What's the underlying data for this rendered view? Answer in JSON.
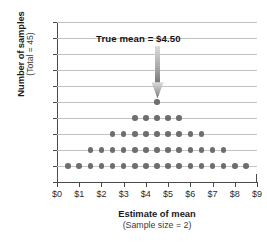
{
  "chart_data": {
    "type": "scatter",
    "title": "",
    "xlabel": "Estimate of mean",
    "xlabel_sub": "(Sample size = 2)",
    "ylabel": "Number of samples",
    "ylabel_sub": "(Total = 45)",
    "xlim": [
      0,
      9
    ],
    "ylim": [
      0,
      10
    ],
    "grid": true,
    "legend": "none",
    "x_tick_labels": [
      "$0",
      "$1",
      "$2",
      "$3",
      "$4",
      "$5",
      "$6",
      "$7",
      "$8",
      "$9"
    ],
    "x_tick_values": [
      0,
      1,
      2,
      3,
      4,
      5,
      6,
      7,
      8,
      9
    ],
    "y_tick_labels": [
      "0",
      "1",
      "2",
      "3",
      "4",
      "5",
      "6",
      "7",
      "8",
      "9",
      "10"
    ],
    "y_tick_values": [
      0,
      1,
      2,
      3,
      4,
      5,
      6,
      7,
      8,
      9,
      10
    ],
    "points": [
      {
        "x": 0.5,
        "y": 1
      },
      {
        "x": 1.0,
        "y": 1
      },
      {
        "x": 1.5,
        "y": 1
      },
      {
        "x": 2.0,
        "y": 1
      },
      {
        "x": 2.5,
        "y": 1
      },
      {
        "x": 3.0,
        "y": 1
      },
      {
        "x": 3.5,
        "y": 1
      },
      {
        "x": 4.0,
        "y": 1
      },
      {
        "x": 4.5,
        "y": 1
      },
      {
        "x": 5.0,
        "y": 1
      },
      {
        "x": 5.5,
        "y": 1
      },
      {
        "x": 6.0,
        "y": 1
      },
      {
        "x": 6.5,
        "y": 1
      },
      {
        "x": 7.0,
        "y": 1
      },
      {
        "x": 7.5,
        "y": 1
      },
      {
        "x": 8.0,
        "y": 1
      },
      {
        "x": 8.5,
        "y": 1
      },
      {
        "x": 1.5,
        "y": 2
      },
      {
        "x": 2.0,
        "y": 2
      },
      {
        "x": 2.5,
        "y": 2
      },
      {
        "x": 3.0,
        "y": 2
      },
      {
        "x": 3.5,
        "y": 2
      },
      {
        "x": 4.0,
        "y": 2
      },
      {
        "x": 4.5,
        "y": 2
      },
      {
        "x": 5.0,
        "y": 2
      },
      {
        "x": 5.5,
        "y": 2
      },
      {
        "x": 6.0,
        "y": 2
      },
      {
        "x": 6.5,
        "y": 2
      },
      {
        "x": 7.0,
        "y": 2
      },
      {
        "x": 7.5,
        "y": 2
      },
      {
        "x": 2.5,
        "y": 3
      },
      {
        "x": 3.0,
        "y": 3
      },
      {
        "x": 3.5,
        "y": 3
      },
      {
        "x": 4.0,
        "y": 3
      },
      {
        "x": 4.5,
        "y": 3
      },
      {
        "x": 5.0,
        "y": 3
      },
      {
        "x": 5.5,
        "y": 3
      },
      {
        "x": 6.0,
        "y": 3
      },
      {
        "x": 6.5,
        "y": 3
      },
      {
        "x": 3.5,
        "y": 4
      },
      {
        "x": 4.0,
        "y": 4
      },
      {
        "x": 4.5,
        "y": 4
      },
      {
        "x": 5.0,
        "y": 4
      },
      {
        "x": 5.5,
        "y": 4
      },
      {
        "x": 4.5,
        "y": 5
      }
    ],
    "dot_counts_by_estimate": {
      "0.5": 1,
      "1.0": 1,
      "1.5": 2,
      "2.0": 2,
      "2.5": 3,
      "3.0": 3,
      "3.5": 4,
      "4.0": 4,
      "4.5": 5,
      "5.0": 4,
      "5.5": 4,
      "6.0": 3,
      "6.5": 3,
      "7.0": 2,
      "7.5": 2,
      "8.0": 1,
      "8.5": 1
    },
    "total_samples": 45,
    "annotation": {
      "text": "True mean  =  $4.50",
      "pointer_x": 4.5,
      "pointer_y": 5,
      "type": "down-arrow"
    },
    "colors": {
      "dot": "#6e6e6e",
      "gridline": "#c2c2c2",
      "axis": "#4a4a4a",
      "arrow_top": "#d8d8d8",
      "arrow_bottom": "#6e6e6e",
      "text": "#1a1a1a",
      "background": "#ffffff"
    }
  }
}
